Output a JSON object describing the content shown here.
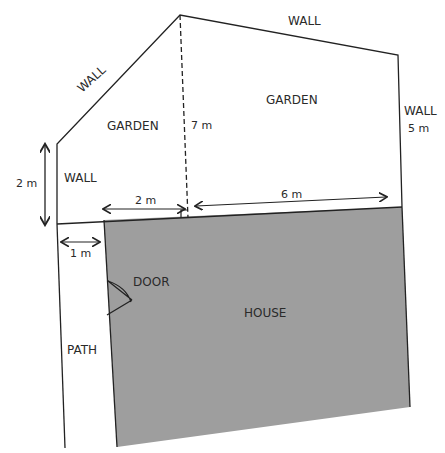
{
  "diagram": {
    "title": "",
    "colors": {
      "house_fill": "#9e9e9e",
      "line": "#222222",
      "background": "#ffffff"
    },
    "labels": {
      "wall_top": "WALL",
      "wall_diagonal": "WALL",
      "wall_left": "WALL",
      "wall_right": "WALL",
      "garden_left": "GARDEN",
      "garden_right": "GARDEN",
      "house": "HOUSE",
      "door": "DOOR",
      "path": "PATH"
    },
    "dimensions": {
      "left_wall_height": "2 m",
      "garden_depth_dashed": "7 m",
      "right_wall_height": "5 m",
      "garden_gap_left": "2 m",
      "house_width_right": "6 m",
      "path_width": "1 m"
    }
  }
}
